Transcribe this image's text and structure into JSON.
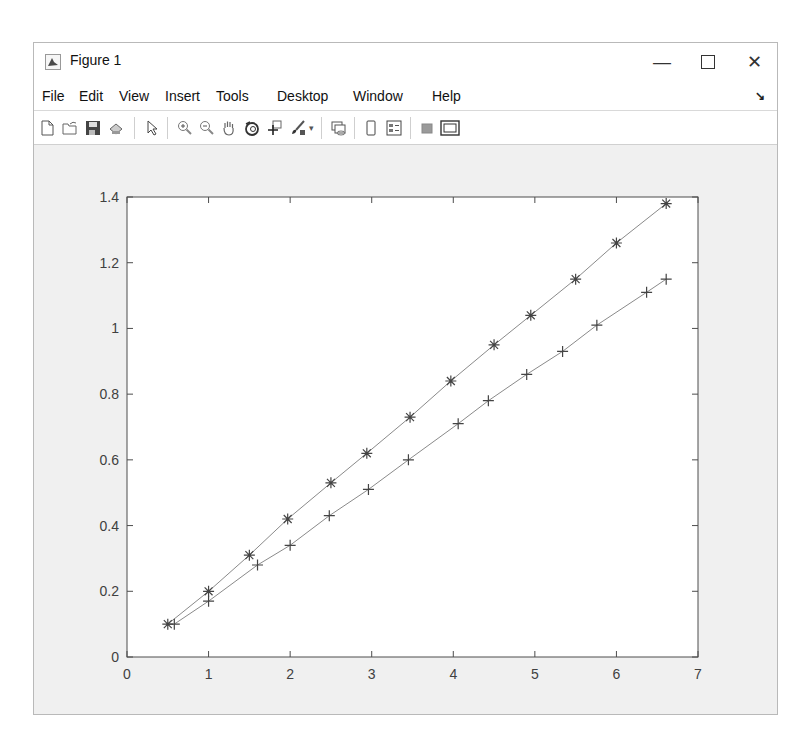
{
  "window": {
    "title": "Figure 1",
    "controls": {
      "minimize": "—",
      "maximize": "☐",
      "close": "✕"
    }
  },
  "menu": {
    "items": [
      "File",
      "Edit",
      "View",
      "Insert",
      "Tools",
      "Desktop",
      "Window",
      "Help"
    ],
    "dock_icon": "↘"
  },
  "toolbar": {
    "buttons": [
      {
        "name": "new-figure",
        "icon": "new-file-icon"
      },
      {
        "name": "open-file",
        "icon": "folder-open-icon"
      },
      {
        "name": "save-figure",
        "icon": "save-icon"
      },
      {
        "name": "print-figure",
        "icon": "print-icon"
      },
      {
        "name": "edit-plot",
        "icon": "pointer-arrow-icon"
      },
      {
        "name": "zoom-in",
        "icon": "zoom-in-icon"
      },
      {
        "name": "zoom-out",
        "icon": "zoom-out-icon"
      },
      {
        "name": "pan",
        "icon": "hand-icon"
      },
      {
        "name": "rotate-3d",
        "icon": "rotate-3d-icon"
      },
      {
        "name": "data-cursor",
        "icon": "data-cursor-icon"
      },
      {
        "name": "brush",
        "icon": "brush-icon"
      },
      {
        "name": "link-plot",
        "icon": "link-plot-icon"
      },
      {
        "name": "hide-plot-tools",
        "icon": "colorbar-icon"
      },
      {
        "name": "insert-legend",
        "icon": "legend-icon"
      },
      {
        "name": "hide-plot-tools2",
        "icon": "gray-square-icon"
      },
      {
        "name": "show-plot-tools",
        "icon": "plot-tools-icon"
      }
    ]
  },
  "colors": {
    "line": "#8a8a8a",
    "marker": "#444444",
    "axis": "#4d4d4d",
    "tick_label": "#404040"
  },
  "chart_data": {
    "type": "line",
    "title": "",
    "xlabel": "",
    "ylabel": "",
    "xlim": [
      0,
      7
    ],
    "ylim": [
      0,
      1.4
    ],
    "xticks": [
      0,
      1,
      2,
      3,
      4,
      5,
      6,
      7
    ],
    "xtick_labels": [
      "0",
      "1",
      "2",
      "3",
      "4",
      "5",
      "6",
      "7"
    ],
    "yticks": [
      0,
      0.2,
      0.4,
      0.6,
      0.8,
      1.0,
      1.2,
      1.4
    ],
    "ytick_labels": [
      "0",
      "0.2",
      "0.4",
      "0.6",
      "0.8",
      "1",
      "1.2",
      "1.4"
    ],
    "grid": false,
    "legend": null,
    "series": [
      {
        "name": "asterisk-series",
        "marker": "*",
        "x": [
          0.5,
          1.0,
          1.5,
          1.97,
          2.5,
          2.94,
          3.47,
          3.97,
          4.5,
          4.95,
          5.5,
          6.0,
          6.61
        ],
        "y": [
          0.1,
          0.2,
          0.31,
          0.42,
          0.53,
          0.62,
          0.73,
          0.84,
          0.95,
          1.04,
          1.15,
          1.26,
          1.38
        ]
      },
      {
        "name": "plus-series",
        "marker": "+",
        "x": [
          0.58,
          1.0,
          1.6,
          2.0,
          2.48,
          2.96,
          3.45,
          4.06,
          4.43,
          4.9,
          5.34,
          5.76,
          6.37,
          6.61
        ],
        "y": [
          0.1,
          0.17,
          0.28,
          0.34,
          0.43,
          0.51,
          0.6,
          0.71,
          0.78,
          0.86,
          0.93,
          1.01,
          1.11,
          1.15
        ]
      }
    ]
  }
}
